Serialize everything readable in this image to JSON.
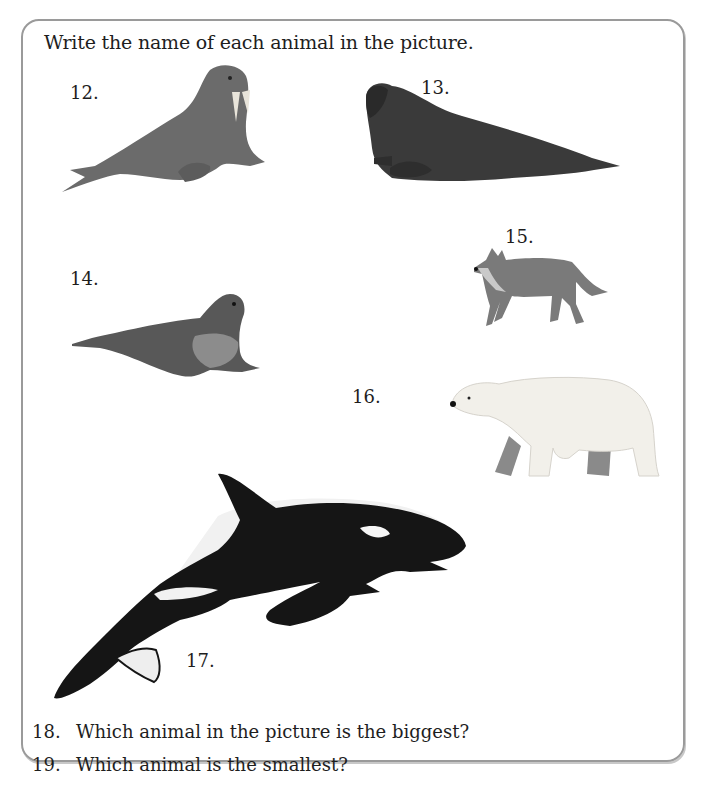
{
  "instruction": "Write the name of each animal in the picture.",
  "animals": [
    {
      "number": "12.",
      "icon": "walrus"
    },
    {
      "number": "13.",
      "icon": "elephant-seal"
    },
    {
      "number": "14.",
      "icon": "seal"
    },
    {
      "number": "15.",
      "icon": "wolf"
    },
    {
      "number": "16.",
      "icon": "polar-bear"
    },
    {
      "number": "17.",
      "icon": "orca"
    }
  ],
  "questions": [
    {
      "number": "18.",
      "text": "Which animal in the picture is the biggest?"
    },
    {
      "number": "19.",
      "text": "Which animal is the smallest?"
    }
  ]
}
